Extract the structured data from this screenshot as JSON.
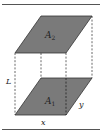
{
  "diagram": {
    "title": "",
    "labels": {
      "top_area": "A",
      "top_area_sub": "2",
      "bottom_area": "A",
      "bottom_area_sub": "1",
      "height": "L",
      "width": "x",
      "depth": "y"
    },
    "colors": {
      "face_fill": "#7a7a7a",
      "edge": "#333333",
      "rule": "#555555",
      "dash": "#444444"
    }
  }
}
